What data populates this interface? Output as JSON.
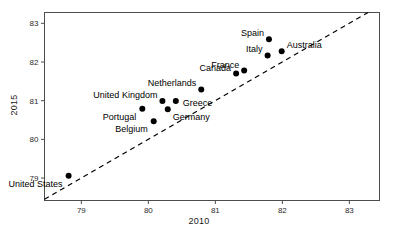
{
  "chart_data": {
    "type": "scatter",
    "title": "",
    "xlabel": "2010",
    "ylabel": "2015",
    "xlim": [
      78.45,
      83.45
    ],
    "ylim": [
      78.42,
      83.28
    ],
    "xticks": [
      79,
      80,
      81,
      82,
      83
    ],
    "yticks": [
      79,
      80,
      81,
      82,
      83
    ],
    "xtick_labels": [
      "79",
      "80",
      "81",
      "82",
      "83"
    ],
    "ytick_labels": [
      "79",
      "80",
      "81",
      "82",
      "83"
    ],
    "grid": false,
    "legend": "none",
    "point_color": "#000000",
    "point_size": 3,
    "reference_line": {
      "name": "identity-line",
      "style": "dashed",
      "color": "#000000",
      "slope": 1,
      "intercept": 0,
      "description": "y = x diagonal dashed line"
    },
    "points": [
      {
        "label": "United States",
        "x": 78.81,
        "y": 79.06,
        "label_pos": "below-left"
      },
      {
        "label": "Portugal",
        "x": 79.91,
        "y": 80.79,
        "label_pos": "below-left"
      },
      {
        "label": "Belgium",
        "x": 80.08,
        "y": 80.47,
        "label_pos": "below-left"
      },
      {
        "label": "United Kingdom",
        "x": 80.21,
        "y": 80.99,
        "label_pos": "above-left"
      },
      {
        "label": "Germany",
        "x": 80.29,
        "y": 80.78,
        "label_pos": "below-right"
      },
      {
        "label": "Greece",
        "x": 80.41,
        "y": 80.99,
        "label_pos": "right"
      },
      {
        "label": "Netherlands",
        "x": 80.79,
        "y": 81.29,
        "label_pos": "above-left"
      },
      {
        "label": "Canada",
        "x": 81.31,
        "y": 81.7,
        "label_pos": "above-left"
      },
      {
        "label": "France",
        "x": 81.43,
        "y": 81.78,
        "label_pos": "above-left"
      },
      {
        "label": "Italy",
        "x": 81.78,
        "y": 82.17,
        "label_pos": "above-left"
      },
      {
        "label": "Spain",
        "x": 81.8,
        "y": 82.59,
        "label_pos": "above-left"
      },
      {
        "label": "Australia",
        "x": 81.99,
        "y": 82.28,
        "label_pos": "above-right"
      }
    ]
  },
  "labels": {
    "united_states": "United States",
    "portugal": "Portugal",
    "belgium": "Belgium",
    "united_kingdom": "United Kingdom",
    "germany": "Germany",
    "greece": "Greece",
    "netherlands": "Netherlands",
    "canada": "Canada",
    "france": "France",
    "italy": "Italy",
    "spain": "Spain",
    "australia": "Australia"
  }
}
